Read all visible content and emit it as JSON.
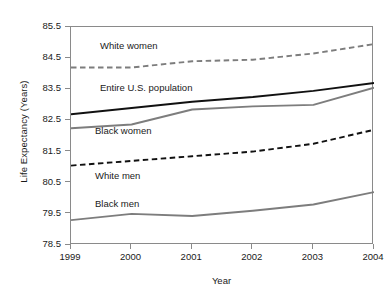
{
  "chart_data": {
    "type": "line",
    "title": "",
    "xlabel": "Year",
    "ylabel": "Life Expectancy (Years)",
    "x": [
      1999,
      2000,
      2001,
      2002,
      2003,
      2004
    ],
    "xticklabels": [
      "1999",
      "2000",
      "2001",
      "2002",
      "2003",
      "2004"
    ],
    "yticklabels": [
      "78.5",
      "79.5",
      "80.5",
      "81.5",
      "82.5",
      "83.5",
      "84.5",
      "85.5"
    ],
    "yticks": [
      78.5,
      79.5,
      80.5,
      81.5,
      82.5,
      83.5,
      84.5,
      85.5
    ],
    "xlim": [
      1999,
      2004
    ],
    "ylim": [
      78.5,
      85.5
    ],
    "grid": false,
    "legend_position": "inline-annotations",
    "series": [
      {
        "name": "White women",
        "values": [
          84.2,
          84.2,
          84.4,
          84.45,
          84.65,
          84.95
        ],
        "color": "#7d7d7d",
        "style": "dashed",
        "label_text": "White women"
      },
      {
        "name": "Entire U.S. population",
        "values": [
          82.7,
          82.9,
          83.1,
          83.25,
          83.45,
          83.7
        ],
        "color": "#111111",
        "style": "solid",
        "label_text": "Entire U.S. population"
      },
      {
        "name": "Black women",
        "values": [
          82.25,
          82.37,
          82.85,
          82.95,
          83.0,
          83.55
        ],
        "color": "#7d7d7d",
        "style": "solid",
        "label_text": "Black women"
      },
      {
        "name": "White men",
        "values": [
          81.05,
          81.2,
          81.35,
          81.5,
          81.75,
          82.2
        ],
        "color": "#111111",
        "style": "dashed",
        "label_text": "White men"
      },
      {
        "name": "Black men",
        "values": [
          79.3,
          79.5,
          79.43,
          79.6,
          79.8,
          80.2
        ],
        "color": "#7d7d7d",
        "style": "solid",
        "label_text": "Black men"
      }
    ],
    "annotations": [
      {
        "text": "White women",
        "x_px": 100,
        "y_px": 40
      },
      {
        "text": "Entire U.S. population",
        "x_px": 100,
        "y_px": 82
      },
      {
        "text": "Black women",
        "x_px": 95,
        "y_px": 125
      },
      {
        "text": "White men",
        "x_px": 95,
        "y_px": 170
      },
      {
        "text": "Black men",
        "x_px": 95,
        "y_px": 198
      }
    ]
  }
}
